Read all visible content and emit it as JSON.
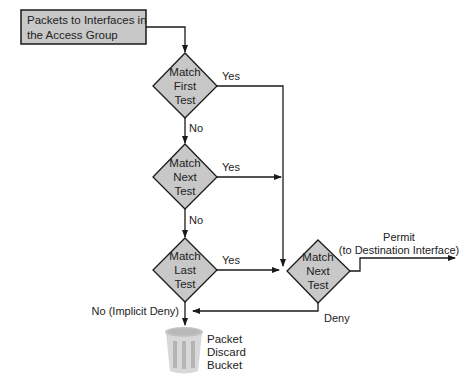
{
  "diagram": {
    "colors": {
      "node_fill": "#c8c8c8",
      "stroke": "#1a1a1a",
      "bin_fill": "#d8d8d8",
      "bin_stripe": "#b5b5b5"
    },
    "start_box": {
      "line1": "Packets to Interfaces in",
      "line2": "the Access Group"
    },
    "decisions": [
      {
        "id": "match-first-test",
        "lines": [
          "Match",
          "First",
          "Test"
        ]
      },
      {
        "id": "match-next-test-1",
        "lines": [
          "Match",
          "Next",
          "Test"
        ]
      },
      {
        "id": "match-last-test",
        "lines": [
          "Match",
          "Last",
          "Test"
        ]
      },
      {
        "id": "match-next-test-2",
        "lines": [
          "Match",
          "Next",
          "Test"
        ]
      }
    ],
    "edge_labels": {
      "yes1": "Yes",
      "no1": "No",
      "yes2": "Yes",
      "no2": "No",
      "yes3": "Yes",
      "implicit_deny": "No (Implicit Deny)",
      "permit_line1": "Permit",
      "permit_line2": "(to Destination Interface)",
      "deny": "Deny"
    },
    "bucket": {
      "lines": [
        "Packet",
        "Discard",
        "Bucket"
      ]
    }
  }
}
